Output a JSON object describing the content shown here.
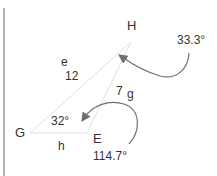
{
  "diagram": {
    "vertices": [
      {
        "name": "G",
        "x": 30,
        "y": 133
      },
      {
        "name": "E",
        "x": 87,
        "y": 133
      },
      {
        "name": "H",
        "x": 131,
        "y": 42
      }
    ],
    "labels": {
      "vertex_h": "H",
      "vertex_g": "G",
      "vertex_e": "E",
      "side_e_name": "e",
      "side_e_value": "12",
      "side_g_value": "7",
      "side_g_name": "g",
      "side_h_name": "h",
      "angle_g": "32°",
      "angle_h": "33.3°",
      "angle_e": "114.7°"
    },
    "colors": {
      "triangle_line": "#e0e0e0",
      "arrow": "#707070",
      "border_line": "#999999",
      "text": "#333333"
    }
  }
}
